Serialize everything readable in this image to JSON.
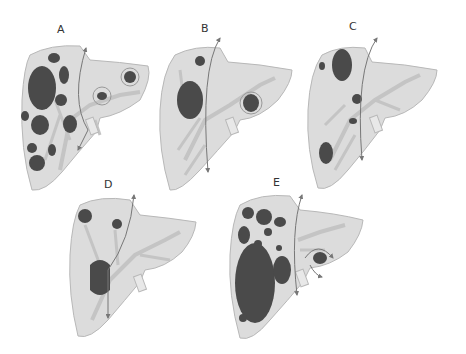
{
  "figure": {
    "colors": {
      "liver_fill": "#dcdcdc",
      "liver_stroke": "#b8b8b8",
      "lesion": "#4a4a4a",
      "vessel": "#c4c4c4",
      "arrow": "#777777"
    },
    "panels": [
      {
        "id": "A",
        "label": "A"
      },
      {
        "id": "B",
        "label": "B"
      },
      {
        "id": "C",
        "label": "C"
      },
      {
        "id": "D",
        "label": "D"
      },
      {
        "id": "E",
        "label": "E"
      }
    ]
  }
}
